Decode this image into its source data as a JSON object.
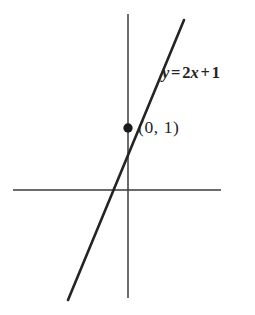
{
  "figure": {
    "kind": "cartesian-line-graph",
    "background_color": "#ffffff",
    "ink_color": "#242424",
    "axis_color": "#3a3a3a",
    "width": 255,
    "height": 315
  },
  "axes": {
    "x_axis": {
      "name": "x-axis",
      "y_pixel": 190,
      "x_start_pixel": 13,
      "x_end_pixel": 221,
      "stroke_width": 1.5
    },
    "y_axis": {
      "name": "y-axis",
      "x_pixel": 128,
      "y_start_pixel": 14,
      "y_end_pixel": 298,
      "stroke_width": 1.5
    },
    "origin_pixel": {
      "x": 128,
      "y": 190
    }
  },
  "labels": {
    "equation": {
      "text": "y = 2x + 1",
      "lhs": "y",
      "equals": "=",
      "coefficient": "2",
      "variable": "x",
      "plus": "+",
      "constant": "1"
    },
    "point": {
      "text": "(0, 1)",
      "open_paren": "(",
      "x_value": "0",
      "comma": ",",
      "y_value": "1",
      "close_paren": ")"
    }
  },
  "chart_data": {
    "type": "line",
    "title": "",
    "xlabel": "",
    "ylabel": "",
    "grid": false,
    "legend": null,
    "annotations": [
      {
        "text": "y = 2x + 1",
        "kind": "equation",
        "at_pixel": {
          "x": 162,
          "y": 73
        }
      },
      {
        "text": "(0, 1)",
        "kind": "point-coordinate",
        "at_pixel": {
          "x": 138,
          "y": 128
        }
      }
    ],
    "series": [
      {
        "name": "y = 2x + 1",
        "equation": "y = 2x + 1",
        "slope": 2,
        "intercept": 1,
        "stroke_width": 2.6,
        "color": "#242424",
        "pixel_endpoints": [
          {
            "x": 184,
            "y": 20
          },
          {
            "x": 68,
            "y": 300
          }
        ],
        "x": [
          -1.9,
          1.9
        ],
        "values": [
          -2.8,
          4.8
        ]
      }
    ],
    "points": [
      {
        "name": "y-intercept",
        "label": "(0, 1)",
        "x": 0,
        "y": 1,
        "pixel": {
          "x": 128,
          "y": 128
        },
        "marker": "filled-circle",
        "radius_px": 4.7,
        "color": "#1b1b1b"
      }
    ],
    "x_intercept": {
      "x": -0.5,
      "y": 0,
      "pixel": {
        "x": 98,
        "y": 190
      }
    },
    "xlim": [
      -3.8,
      3.1
    ],
    "ylim": [
      -3.6,
      5.6
    ]
  }
}
